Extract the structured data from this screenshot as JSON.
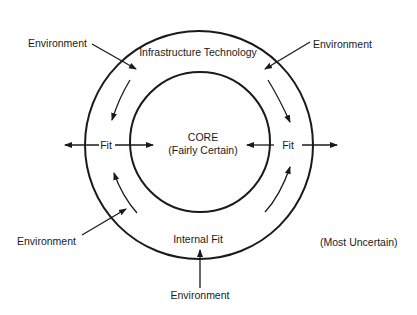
{
  "diagram": {
    "core": {
      "title": "CORE",
      "subtitle": "(Fairly Certain)"
    },
    "outer_ring_label": "Infrastructure Technology",
    "bottom_ring_label": "Internal Fit",
    "fit_left": "Fit",
    "fit_right": "Fit",
    "environment_labels": {
      "top_left": "Environment",
      "top_right": "Environment",
      "bottom_left": "Environment",
      "bottom": "Environment"
    },
    "outer_note": "(Most Uncertain)",
    "colors": {
      "line": "#1a1a1a",
      "background": "#ffffff"
    }
  }
}
